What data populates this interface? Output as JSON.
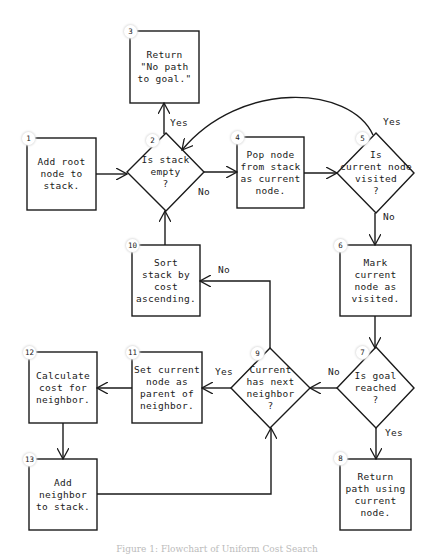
{
  "diagram": {
    "type": "flowchart",
    "stroke_color": "#1a1a1a",
    "background": "#ffffff",
    "nodes": [
      {
        "id": "1",
        "shape": "rect",
        "label": "Add root\nnode to\nstack."
      },
      {
        "id": "2",
        "shape": "diamond",
        "label": "Is stack\nempty\n?"
      },
      {
        "id": "3",
        "shape": "rect",
        "label": "Return\n\"No path\nto goal.\""
      },
      {
        "id": "4",
        "shape": "rect",
        "label": "Pop node\nfrom stack\nas current\nnode."
      },
      {
        "id": "5",
        "shape": "diamond",
        "label": "Is\ncurrent node\nvisited\n?"
      },
      {
        "id": "6",
        "shape": "rect",
        "label": "Mark\ncurrent\nnode as\nvisited."
      },
      {
        "id": "7",
        "shape": "diamond",
        "label": "Is goal\nreached\n?"
      },
      {
        "id": "8",
        "shape": "rect",
        "label": "Return\npath using\ncurrent\nnode."
      },
      {
        "id": "9",
        "shape": "diamond",
        "label": "Current\nhas next\nneighbor\n?"
      },
      {
        "id": "10",
        "shape": "rect",
        "label": "Sort\nstack by\ncost\nascending."
      },
      {
        "id": "11",
        "shape": "rect",
        "label": "Set current\nnode as\nparent of\nneighbor."
      },
      {
        "id": "12",
        "shape": "rect",
        "label": "Calculate\ncost for\nneighbor."
      },
      {
        "id": "13",
        "shape": "rect",
        "label": "Add\nneighbor\nto stack."
      }
    ],
    "edges": [
      {
        "from": "1",
        "to": "2",
        "label": ""
      },
      {
        "from": "2",
        "to": "3",
        "label": "Yes"
      },
      {
        "from": "2",
        "to": "4",
        "label": "No"
      },
      {
        "from": "4",
        "to": "5",
        "label": ""
      },
      {
        "from": "5",
        "to": "2",
        "label": "Yes"
      },
      {
        "from": "5",
        "to": "6",
        "label": "No"
      },
      {
        "from": "6",
        "to": "7",
        "label": ""
      },
      {
        "from": "7",
        "to": "8",
        "label": "Yes"
      },
      {
        "from": "7",
        "to": "9",
        "label": "No"
      },
      {
        "from": "9",
        "to": "11",
        "label": "Yes"
      },
      {
        "from": "9",
        "to": "10",
        "label": "No"
      },
      {
        "from": "10",
        "to": "2",
        "label": ""
      },
      {
        "from": "11",
        "to": "12",
        "label": ""
      },
      {
        "from": "12",
        "to": "13",
        "label": ""
      },
      {
        "from": "13",
        "to": "9",
        "label": ""
      }
    ],
    "edge_labels": {
      "yes": "Yes",
      "no": "No"
    }
  },
  "caption": "Figure 1: Flowchart of Uniform Cost Search"
}
